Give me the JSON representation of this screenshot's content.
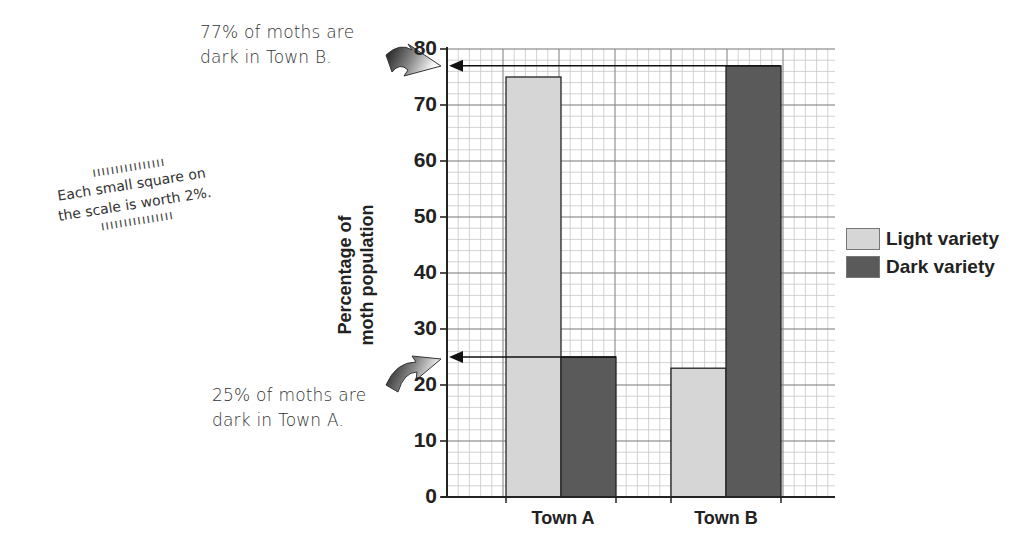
{
  "chart_data": {
    "type": "bar",
    "title": "",
    "xlabel": "",
    "ylabel": "Percentage of moth population",
    "ylabel_lines": [
      "Percentage of",
      "moth population"
    ],
    "categories": [
      "Town A",
      "Town B"
    ],
    "series": [
      {
        "name": "Light variety",
        "color": "#d6d6d6",
        "values": [
          75,
          23
        ]
      },
      {
        "name": "Dark variety",
        "color": "#5a5a5a",
        "values": [
          25,
          77
        ]
      }
    ],
    "ylim": [
      0,
      80
    ],
    "yticks": [
      0,
      10,
      20,
      30,
      40,
      50,
      60,
      70,
      80
    ],
    "grid": true,
    "grid_minor_step": 2,
    "legend_position": "right",
    "annotations": [
      {
        "text_lines": [
          "77% of moths are",
          "dark in Town B."
        ],
        "value": 77
      },
      {
        "text_lines": [
          "25% of moths are",
          "dark in Town A."
        ],
        "value": 25
      },
      {
        "text_lines": [
          "Each small square on",
          "the scale is worth 2%."
        ]
      }
    ]
  },
  "notes": {
    "top": {
      "line1": "77% of moths are",
      "line2": "dark in Town B."
    },
    "bottom": {
      "line1": "25% of moths are",
      "line2": "dark in Town A."
    },
    "scale": {
      "line1": "Each small square on",
      "line2": "the scale is worth 2%."
    }
  },
  "axis": {
    "ylabel_line1": "Percentage of",
    "ylabel_line2": "moth population",
    "ticks": [
      "0",
      "10",
      "20",
      "30",
      "40",
      "50",
      "60",
      "70",
      "80"
    ]
  },
  "categories": [
    "Town A",
    "Town B"
  ],
  "legend": [
    {
      "label": "Light variety",
      "color": "#d6d6d6"
    },
    {
      "label": "Dark variety",
      "color": "#5a5a5a"
    }
  ]
}
